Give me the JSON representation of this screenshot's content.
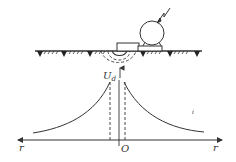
{
  "diagram": {
    "labels": {
      "potential": "U",
      "potential_sub": "d",
      "left_axis": "r",
      "right_axis": "r",
      "origin": "O",
      "stray_mark": "i"
    },
    "colors": {
      "stroke": "#333333",
      "background": "#ffffff"
    },
    "elements": {
      "ground_surface": "hatched-ground-line",
      "electrode": "grounding-electrode-box",
      "equipment": "motor-on-base",
      "fault": "lightning-bolt",
      "equipotential": "dashed-hemispheres",
      "curve": "potential-distribution-curve"
    }
  }
}
